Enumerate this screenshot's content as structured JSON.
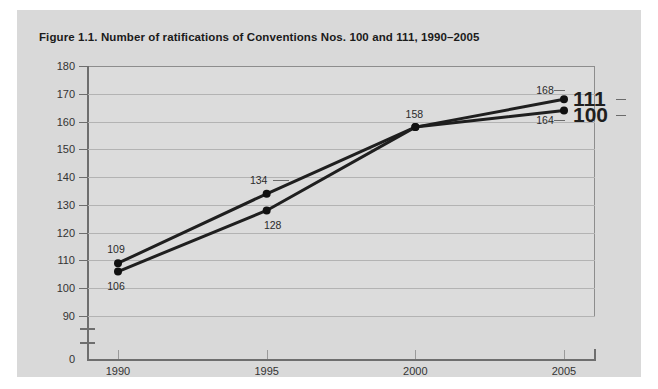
{
  "figure": {
    "title": "Figure 1.1. Number of ratifications of Conventions Nos. 100 and 111, 1990–2005",
    "card_background": "#d9d9d9",
    "plot_background": "#dcdcdc"
  },
  "chart_data": {
    "type": "line",
    "title": "Figure 1.1. Number of ratifications of Conventions Nos. 100 and 111, 1990–2005",
    "xlabel": "",
    "ylabel": "",
    "x": [
      1990,
      1995,
      2000,
      2005
    ],
    "categories": [
      "1990",
      "1995",
      "2000",
      "2005"
    ],
    "series": [
      {
        "name": "111",
        "label": "111",
        "color": "#1f1f1f",
        "values": [
          109,
          134,
          158,
          168
        ],
        "point_labels": [
          "109",
          "134",
          "158",
          "168"
        ]
      },
      {
        "name": "100",
        "label": "100",
        "color": "#1f1f1f",
        "values": [
          106,
          128,
          158,
          164
        ],
        "point_labels": [
          "106",
          "128",
          "158",
          "164"
        ]
      }
    ],
    "ylim": [
      90,
      180
    ],
    "y_ticks": [
      180,
      170,
      160,
      150,
      140,
      130,
      120,
      110,
      100,
      90
    ],
    "y_tick_labels": [
      "180",
      "170",
      "160",
      "150",
      "140",
      "130",
      "120",
      "110",
      "100",
      "90"
    ],
    "y_zero_label": "0",
    "y_axis_break": true,
    "x_tick_labels": [
      "1990",
      "1995",
      "2000",
      "2005"
    ],
    "grid": true,
    "legend_position": "right-inline",
    "annotations": [
      {
        "text": "109",
        "x": 1990,
        "y": 109
      },
      {
        "text": "106",
        "x": 1990,
        "y": 106
      },
      {
        "text": "134",
        "x": 1995,
        "y": 134
      },
      {
        "text": "128",
        "x": 1995,
        "y": 128
      },
      {
        "text": "158",
        "x": 2000,
        "y": 158
      },
      {
        "text": "168",
        "x": 2005,
        "y": 168
      },
      {
        "text": "164",
        "x": 2005,
        "y": 164
      }
    ]
  }
}
